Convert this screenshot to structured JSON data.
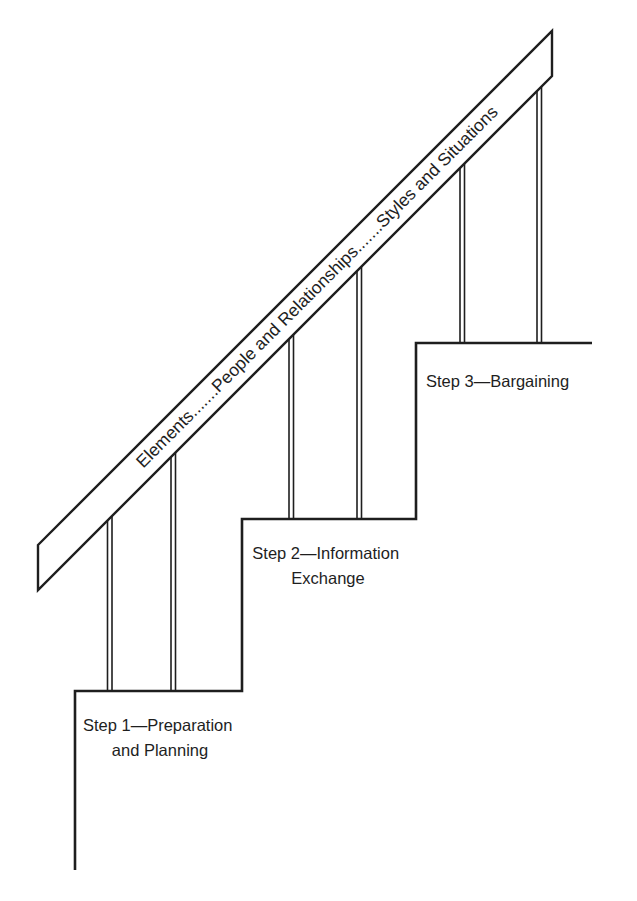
{
  "diagram": {
    "type": "staircase",
    "handrail": {
      "label": "Elements.......People and Relationships.......Styles and Situations"
    },
    "steps": [
      {
        "line1": "Step 1—Preparation",
        "line2": "and Planning"
      },
      {
        "line1": "Step 2—Information",
        "line2": "Exchange"
      },
      {
        "line1": "Step 3—Bargaining"
      }
    ],
    "colors": {
      "ink": "#1e1e1e",
      "background": "#ffffff"
    }
  }
}
